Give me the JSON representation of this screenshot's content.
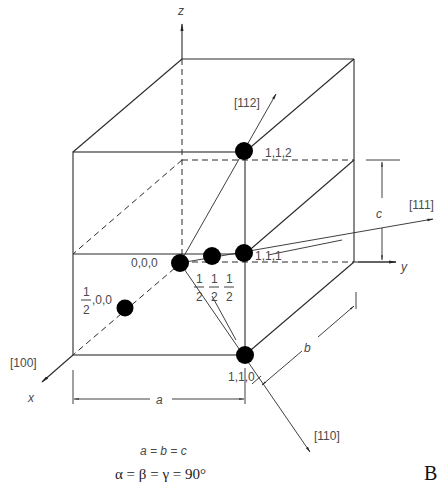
{
  "diagram": {
    "type": "cubic unit cell with lattice points and crystallographic directions",
    "axes": {
      "x": "x",
      "y": "y",
      "z": "z"
    },
    "lattice_points": [
      {
        "label": "0,0,0",
        "coords": [
          0,
          0,
          0
        ]
      },
      {
        "label_num": "1",
        "label_den": "2",
        "label_rest": ",0,0",
        "coords": [
          0.5,
          0,
          0
        ]
      },
      {
        "label_num": "1",
        "label_den": "2",
        "coords": [
          0.5,
          0.5,
          0.5
        ]
      },
      {
        "label": "1,1,1",
        "coords": [
          1,
          1,
          1
        ]
      },
      {
        "label": "1,1,2",
        "coords": [
          1,
          1,
          2
        ]
      },
      {
        "label": "1,1,0",
        "coords": [
          1,
          1,
          0
        ]
      }
    ],
    "directions": [
      {
        "label": "[100]"
      },
      {
        "label": "[110]"
      },
      {
        "label": "[111]"
      },
      {
        "label": "[112]"
      }
    ],
    "dimensions": {
      "a": "a",
      "b": "b",
      "c": "c"
    },
    "relations": {
      "lengths": "a = b = c",
      "angles": "α = β = γ = 90°"
    },
    "panel_label": "B"
  }
}
